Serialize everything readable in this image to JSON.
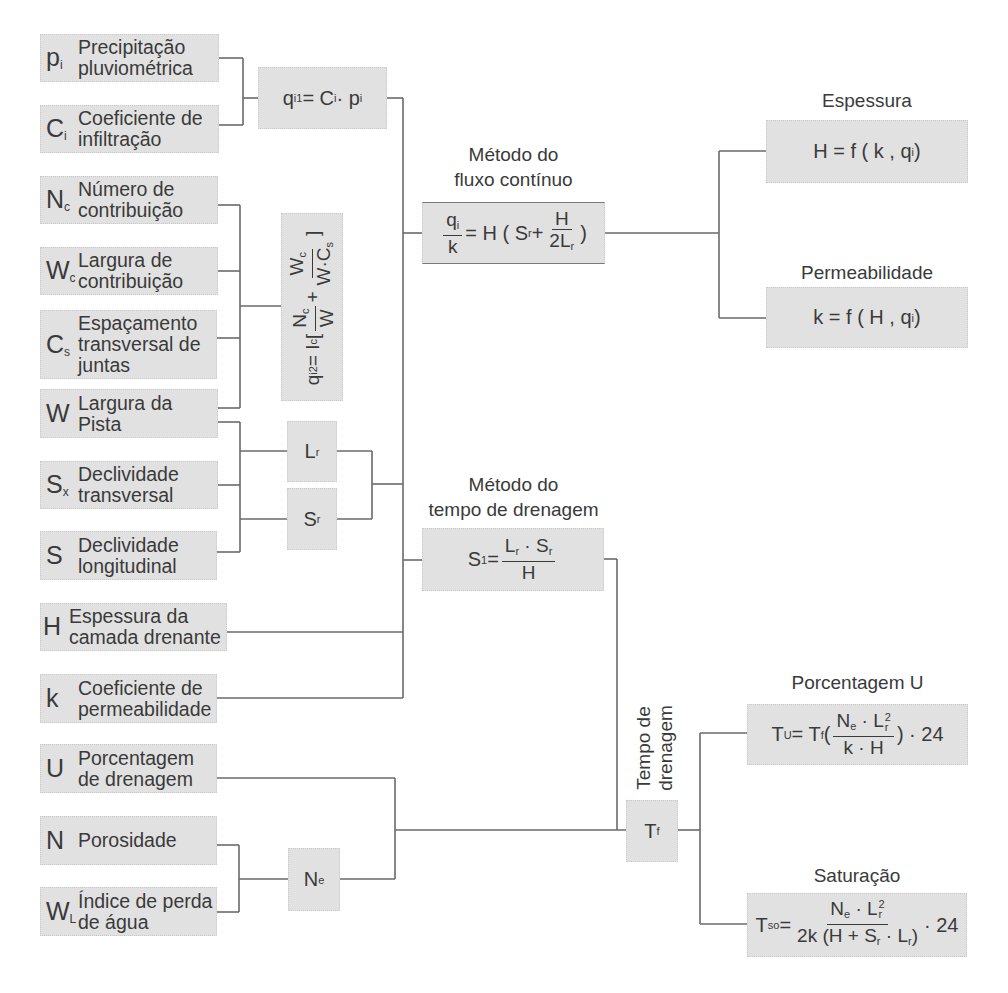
{
  "inputs": [
    {
      "symbol": "p",
      "sub": "i",
      "label_lines": [
        "Precipitação",
        "pluviométrica"
      ]
    },
    {
      "symbol": "C",
      "sub": "i",
      "label_lines": [
        "Coeficiente de",
        "infiltração"
      ]
    },
    {
      "symbol": "N",
      "sub": "c",
      "label_lines": [
        "Número de",
        "contribuição"
      ]
    },
    {
      "symbol": "W",
      "sub": "c",
      "label_lines": [
        "Largura de",
        "contribuição"
      ]
    },
    {
      "symbol": "C",
      "sub": "s",
      "label_lines": [
        "Espaçamento",
        "transversal de",
        "juntas"
      ]
    },
    {
      "symbol": "W",
      "sub": "",
      "label_lines": [
        "Largura da",
        "Pista"
      ]
    },
    {
      "symbol": "S",
      "sub": "x",
      "label_lines": [
        "Declividade",
        "transversal"
      ]
    },
    {
      "symbol": "S",
      "sub": "",
      "label_lines": [
        "Declividade",
        "longitudinal"
      ]
    },
    {
      "symbol": "H",
      "sub": "",
      "label_lines": [
        "Espessura da",
        "camada drenante"
      ]
    },
    {
      "symbol": "k",
      "sub": "",
      "label_lines": [
        "Coeficiente de",
        "permeabilidade"
      ]
    },
    {
      "symbol": "U",
      "sub": "",
      "label_lines": [
        "Porcentagem",
        "de drenagem"
      ]
    },
    {
      "symbol": "N",
      "sub": "",
      "label_lines": [
        "Porosidade"
      ]
    },
    {
      "symbol": "W",
      "sub": "L",
      "label_lines": [
        "Índice de perda",
        "de água"
      ]
    }
  ],
  "intermediates": {
    "qi1": {
      "q": "q",
      "q_sub": "i1",
      "eq": " = C",
      "c_sub": "i",
      "dot": " · p",
      "p_sub": "i"
    },
    "qi2": {
      "q": "q",
      "q_sub": "i2",
      "eq": " = I",
      "i_sub": "c",
      "lb": " [ ",
      "n": "N",
      "n_sub": "c",
      "w": "W",
      "plus": " + ",
      "wc": "W",
      "wc_sub": "c",
      "wcs": "W·C",
      "wcs_sub": "s",
      "rb": " ]"
    },
    "lr": {
      "sym": "L",
      "sub": "r"
    },
    "sr": {
      "sym": "S",
      "sub": "r"
    },
    "ne": {
      "sym": "N",
      "sub": "e"
    },
    "tf": {
      "sym": "T",
      "sub": "f",
      "label_lines": [
        "Tempo de",
        "drenagem"
      ]
    }
  },
  "methods": [
    {
      "title_lines": [
        "Método do",
        "fluxo contínuo"
      ],
      "formula": {
        "num": "q",
        "num_sub": "i",
        "den": "k",
        "eq": "= H ( S",
        "s_sub": "r",
        "plus": " + ",
        "num2": "H",
        "den2": "2L",
        "den2_sub": "r",
        "close": " )"
      }
    },
    {
      "title_lines": [
        "Método do",
        "tempo de drenagem"
      ],
      "formula": {
        "s": "S",
        "s_sub": "1",
        "eq": " = ",
        "num": "L",
        "num_sub1": "r",
        "dot": " · S",
        "num_sub2": "r",
        "den": "H"
      }
    }
  ],
  "outputs": [
    {
      "title": "Espessura",
      "formula": {
        "text": "H = f ( k , q",
        "sub": "i",
        "close": " )"
      }
    },
    {
      "title": "Permeabilidade",
      "formula": {
        "text": "k = f ( H , q",
        "sub": "i",
        "close": " )"
      }
    },
    {
      "title": "Porcentagem U",
      "formula": {
        "t": "T",
        "t_sub": "U",
        "eq": "= T",
        "tf_sub": "f",
        "open": "(",
        "num": "N",
        "num_sub": "e",
        "dot": " · L",
        "l_sub": "r",
        "sup": "2",
        "den": "k · H",
        "close": ") · 24"
      }
    },
    {
      "title": "Saturação",
      "formula": {
        "t": "T",
        "t_sub": "so",
        "eq": " = ",
        "num": "N",
        "num_sub": "e",
        "dot": " · L",
        "l_sub": "r",
        "sup": "2",
        "den": "2k (H + S",
        "den_sub": "r",
        "den2": " · L",
        "den2_sub": "r",
        "den_close": ")",
        "tail": " · 24"
      }
    }
  ]
}
